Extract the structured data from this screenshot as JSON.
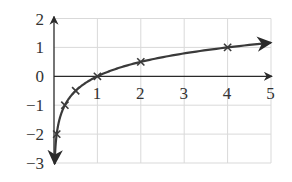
{
  "chart_data": {
    "type": "line",
    "title": "",
    "xlabel": "",
    "ylabel": "",
    "xlim": [
      0,
      5
    ],
    "ylim": [
      -3,
      2
    ],
    "grid": true,
    "legend": null,
    "x_ticks": [
      "1",
      "2",
      "3",
      "4",
      "5"
    ],
    "y_ticks": [
      "2",
      "1",
      "0",
      "-1",
      "-2",
      "-3"
    ],
    "series": [
      {
        "name": "y = log4(x)",
        "function": "log4",
        "markers": [
          {
            "x": 0.0625,
            "y": -2
          },
          {
            "x": 0.25,
            "y": -1
          },
          {
            "x": 0.5,
            "y": -0.5
          },
          {
            "x": 1,
            "y": 0
          },
          {
            "x": 2,
            "y": 0.5
          },
          {
            "x": 4,
            "y": 1
          }
        ],
        "curve_start": {
          "x": 0.015,
          "y": -3
        },
        "curve_end": {
          "x": 5,
          "y": 1.16
        },
        "marker": "x",
        "arrow_at_ends": true
      }
    ],
    "colors": {
      "curve": "#3a3a3a",
      "axes": "#2a2a2a",
      "grid": "#d9d9d9",
      "text": "#333333"
    }
  }
}
